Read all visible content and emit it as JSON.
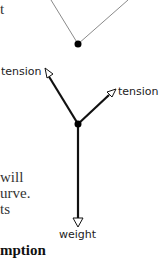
{
  "text_fragments": {
    "line1": "t",
    "line2": "will",
    "line3": "urve.",
    "line4": "ts",
    "line5": "mption"
  },
  "diagram": {
    "top_figure": {
      "description": "rope hanging in V shape with weight point",
      "line_color": "#888888",
      "dot_color": "#000000"
    },
    "force_diagram": {
      "labels": {
        "left_tension": "tension",
        "right_tension": "tension",
        "weight": "weight"
      },
      "arrow_color": "#111111"
    }
  }
}
